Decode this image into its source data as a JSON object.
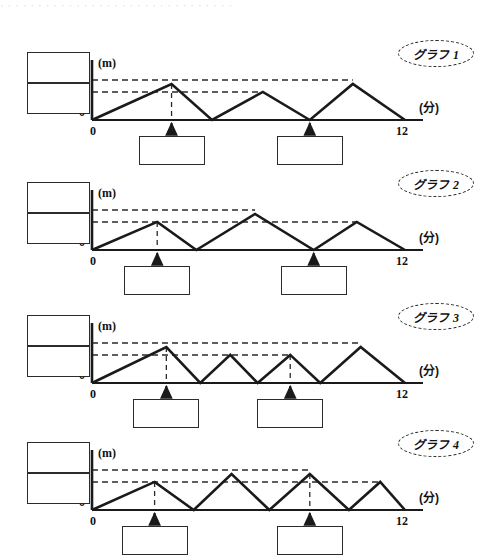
{
  "page": {
    "cut_off_header_text": "· · · · ·   · · · ·   · ·  · ·   · ·      · · ·  · · · ·  · · · ·  · · ·   · ·",
    "width": 487,
    "height": 557,
    "ink_color": "#1a1a1a",
    "dashed_color": "#2a2a2a",
    "paper_color": "#ffffff"
  },
  "axis": {
    "y_unit_label": "(m)",
    "x_unit_label": "(分)",
    "origin_label": "0",
    "x_start_label": "0",
    "x_end_label": "12"
  },
  "chart_data": {
    "type": "line",
    "title": "",
    "xlabel": "(分)",
    "ylabel": "(m)",
    "xlim": [
      0,
      12
    ],
    "ylim": [
      0,
      1.15
    ],
    "grid": false,
    "legend": "none",
    "levels": {
      "high": 1.0,
      "low": 0.78
    },
    "series": [
      {
        "name": "グラフ 1",
        "peak_count": 3,
        "x": [
          0,
          3.05,
          4.6,
          6.55,
          8.35,
          10.0,
          12.0
        ],
        "y": [
          0,
          1.0,
          0,
          0.78,
          0,
          1.0,
          0
        ],
        "marked_times_x": [
          3.05,
          8.35
        ],
        "dashed_drop_from_peaks": [
          1,
          3
        ]
      },
      {
        "name": "グラフ 2",
        "peak_count": 3,
        "x": [
          0,
          2.5,
          4.0,
          6.25,
          8.5,
          10.15,
          12.0
        ],
        "y": [
          0,
          0.78,
          0,
          1.0,
          0,
          0.78,
          0
        ],
        "marked_times_x": [
          2.5,
          8.5
        ],
        "dashed_drop_from_peaks": [
          1,
          3
        ]
      },
      {
        "name": "グラフ 3",
        "peak_count": 4,
        "x": [
          0,
          2.85,
          4.15,
          5.3,
          6.35,
          7.6,
          8.75,
          10.3,
          12.0
        ],
        "y": [
          0,
          1.0,
          0,
          0.78,
          0,
          0.78,
          0,
          1.0,
          0
        ],
        "marked_times_x": [
          2.85,
          7.6
        ],
        "dashed_drop_from_peaks": [
          1,
          5
        ]
      },
      {
        "name": "グラフ 4",
        "peak_count": 4,
        "x": [
          0,
          2.4,
          3.9,
          5.35,
          6.8,
          8.35,
          9.85,
          11.05,
          12.0
        ],
        "y": [
          0,
          0.78,
          0,
          1.0,
          0,
          1.0,
          0,
          0.78,
          0
        ],
        "marked_times_x": [
          2.4,
          8.35
        ],
        "dashed_drop_from_peaks": [
          1,
          5
        ]
      }
    ]
  },
  "graphs": [
    {
      "tag_label": "グラフ 1",
      "y_unit": "(m)",
      "x_unit": "(分)",
      "origin": "0",
      "x_start": "0",
      "x_end": "12",
      "left_boxes": [
        {
          "value": ""
        },
        {
          "value": ""
        }
      ],
      "bottom_boxes": [
        {
          "value": ""
        },
        {
          "value": ""
        }
      ]
    },
    {
      "tag_label": "グラフ 2",
      "y_unit": "(m)",
      "x_unit": "(分)",
      "origin": "0",
      "x_start": "0",
      "x_end": "12",
      "left_boxes": [
        {
          "value": ""
        },
        {
          "value": ""
        }
      ],
      "bottom_boxes": [
        {
          "value": ""
        },
        {
          "value": ""
        }
      ]
    },
    {
      "tag_label": "グラフ 3",
      "y_unit": "(m)",
      "x_unit": "(分)",
      "origin": "0",
      "x_start": "0",
      "x_end": "12",
      "left_boxes": [
        {
          "value": ""
        },
        {
          "value": ""
        }
      ],
      "bottom_boxes": [
        {
          "value": ""
        },
        {
          "value": ""
        }
      ]
    },
    {
      "tag_label": "グラフ 4",
      "y_unit": "(m)",
      "x_unit": "(分)",
      "origin": "0",
      "x_start": "0",
      "x_end": "12",
      "left_boxes": [
        {
          "value": ""
        },
        {
          "value": ""
        }
      ],
      "bottom_boxes": [
        {
          "value": ""
        },
        {
          "value": ""
        }
      ]
    }
  ]
}
